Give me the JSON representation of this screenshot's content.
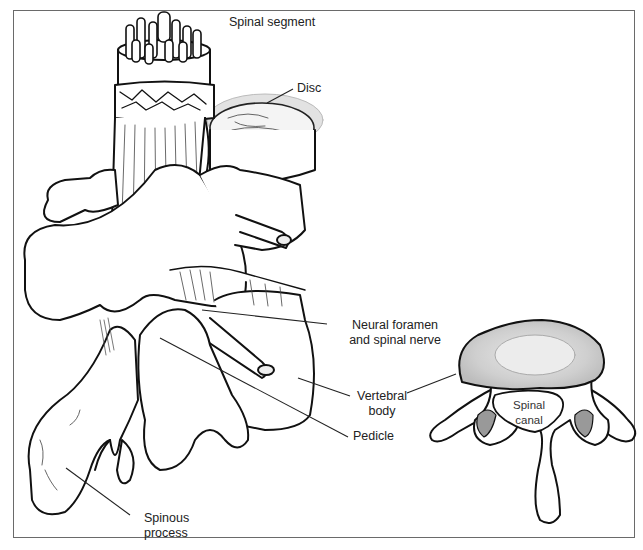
{
  "figure": {
    "title": "Spinal segment",
    "colors": {
      "line": "#111111",
      "frame": "#6a6a6a",
      "background": "#ffffff",
      "shade": "#d9d9d9"
    },
    "labels": {
      "spinal_segment": "Spinal segment",
      "disc": "Disc",
      "neural_foramen_line1": "Neural foramen",
      "neural_foramen_line2": "and spinal nerve",
      "vertebral_body_line1": "Vertebral",
      "vertebral_body_line2": "body",
      "pedicle": "Pedicle",
      "spinous_process_line1": "Spinous",
      "spinous_process_line2": "process",
      "spinal_canal_line1": "Spinal",
      "spinal_canal_line2": "canal"
    },
    "views": [
      "lateral-oblique spinal segment",
      "axial vertebra cross-section"
    ]
  }
}
